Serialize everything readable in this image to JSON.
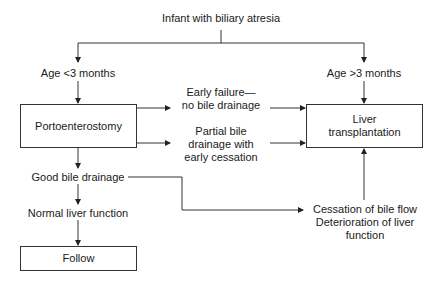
{
  "diagram": {
    "root": "Infant with biliary atresia",
    "age_under": "Age <3 months",
    "age_over": "Age >3 months",
    "portoenterostomy": "Portoenterostomy",
    "liver_transplant_line1": "Liver",
    "liver_transplant_line2": "transplantation",
    "early_failure_line1": "Early failure—",
    "early_failure_line2": "no bile drainage",
    "partial_line1": "Partial bile",
    "partial_line2": "drainage with",
    "partial_line3": "early cessation",
    "good_drainage": "Good bile drainage",
    "normal_liver": "Normal liver function",
    "follow": "Follow",
    "cessation_line1": "Cessation of bile flow",
    "cessation_line2": "Deterioration of liver",
    "cessation_line3": "function"
  }
}
